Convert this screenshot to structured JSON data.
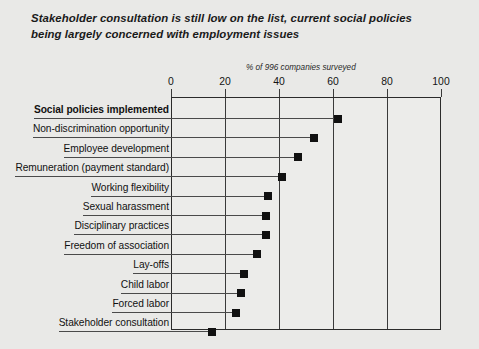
{
  "title": {
    "line1": "Stakeholder consultation is still low on the list, current social policies",
    "line2": "being largely concerned with employment issues"
  },
  "chart_data": {
    "type": "bar",
    "title": "Stakeholder consultation is still low on the list, current social policies being largely concerned with employment issues",
    "subtitle": "% of 996 companies surveyed",
    "xlabel": "% of 996 companies surveyed",
    "ylabel": "",
    "xlim": [
      0,
      100
    ],
    "xticks": [
      0,
      20,
      40,
      60,
      80,
      100
    ],
    "xtick_labels": [
      "0",
      "20",
      "40",
      "60",
      "80",
      "100"
    ],
    "grid": true,
    "legend": "none",
    "orientation": "horizontal",
    "marker": "square",
    "categories": [
      "Social policies implemented",
      "Non-discrimination opportunity",
      "Employee development",
      "Remuneration (payment standard)",
      "Working flexibility",
      "Sexual harassment",
      "Disciplinary practices",
      "Freedom of association",
      "Lay-offs",
      "Child labor",
      "Forced labor",
      "Stakeholder consultation"
    ],
    "values": [
      62,
      53,
      47,
      41,
      36,
      35,
      35,
      32,
      27,
      26,
      24,
      15
    ],
    "emphasized_categories": [
      "Social policies implemented"
    ]
  },
  "colors": {
    "background": "#e9e9e7",
    "plot_background": "#ececea",
    "marker": "#111111",
    "axis": "#2b2b2b",
    "text": "#111111"
  }
}
